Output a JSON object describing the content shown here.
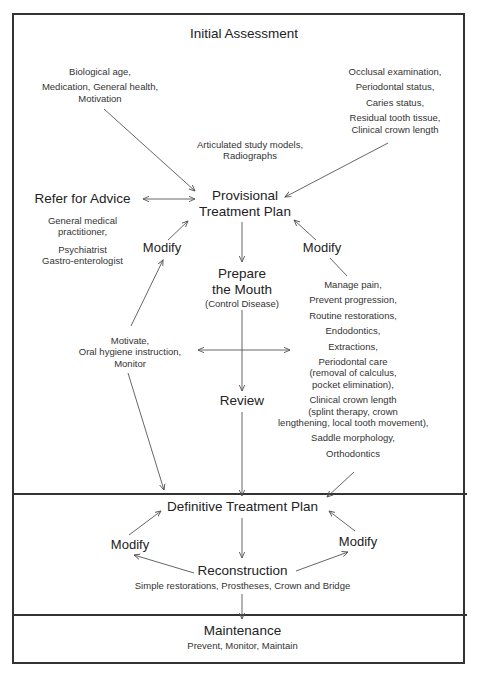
{
  "sections": {
    "initial_assessment": {
      "title": "Initial Assessment",
      "left_factors": [
        "Biological age,",
        "Medication, General health,",
        "Motivation"
      ],
      "center_factors": [
        "Articulated study models,",
        "Radiographs"
      ],
      "right_factors": [
        "Occlusal examination,",
        "Periodontal status,",
        "Caries status,",
        "Residual tooth tissue,",
        "Clinical crown length"
      ],
      "provisional_plan": [
        "Provisional",
        "Treatment Plan"
      ],
      "refer": {
        "title": "Refer for Advice",
        "items": [
          "General medical",
          "practitioner,",
          "Psychiatrist",
          "Gastro-enterologist"
        ]
      },
      "modify_left": "Modify",
      "modify_right": "Modify",
      "prepare": {
        "title": [
          "Prepare",
          "the Mouth"
        ],
        "subtitle": "(Control Disease)"
      },
      "motivate": [
        "Motivate,",
        "Oral hygiene instruction,",
        "Monitor"
      ],
      "procedures": [
        "Manage pain,",
        "Prevent progression,",
        "Routine restorations,",
        "Endodontics,",
        "Extractions,",
        "Periodontal care",
        "(removal of calculus,",
        "pocket elimination),",
        "Clinical crown length",
        "(splint therapy, crown",
        "lengthening, local tooth movement),",
        "Saddle morphology,",
        "Orthodontics"
      ],
      "review": "Review"
    },
    "definitive": {
      "title": "Definitive Treatment Plan",
      "modify_left": "Modify",
      "modify_right": "Modify",
      "reconstruction": "Reconstruction",
      "reconstruction_items": "Simple restorations, Prostheses, Crown and Bridge"
    },
    "maintenance": {
      "title": "Maintenance",
      "items": "Prevent, Monitor, Maintain"
    }
  },
  "colors": {
    "line": "#333333",
    "text": "#222222",
    "background": "#ffffff"
  }
}
